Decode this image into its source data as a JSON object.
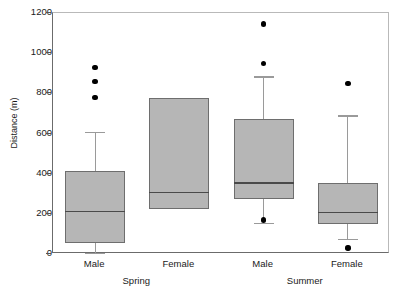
{
  "chart_data": {
    "type": "box",
    "title": "",
    "xlabel": "",
    "ylabel": "Distance (m)",
    "ylim": [
      0,
      1200
    ],
    "yticks": [
      0,
      200,
      400,
      600,
      800,
      1000,
      1200
    ],
    "grid": false,
    "legend": "none",
    "categories": [
      "Male",
      "Female",
      "Male",
      "Female"
    ],
    "groups": [
      {
        "season": "Spring",
        "sex": "Male",
        "whisker_low": 5,
        "q1": 55,
        "median": 215,
        "q3": 415,
        "whisker_high": 608,
        "outliers": [
          780,
          860,
          930
        ]
      },
      {
        "season": "Spring",
        "sex": "Female",
        "whisker_low": 222,
        "q1": 222,
        "median": 310,
        "q3": 778,
        "whisker_high": 778,
        "outliers": []
      },
      {
        "season": "Summer",
        "sex": "Male",
        "whisker_low": 155,
        "q1": 275,
        "median": 358,
        "q3": 672,
        "whisker_high": 885,
        "outliers": [
          170,
          950,
          1145
        ]
      },
      {
        "season": "Summer",
        "sex": "Female",
        "whisker_low": 75,
        "q1": 150,
        "median": 210,
        "q3": 355,
        "whisker_high": 690,
        "outliers": [
          30,
          850
        ]
      }
    ],
    "season_labels": [
      "Spring",
      "Summer"
    ],
    "colors": {
      "box_fill": "#b6b6b6",
      "box_edge": "#6e6e6e",
      "median": "#4a4a4a",
      "whisker": "#9a9a9a",
      "outlier": "#000000",
      "axis": "#6b6b6b",
      "text": "#1a1a1a",
      "background": "#ffffff"
    }
  }
}
